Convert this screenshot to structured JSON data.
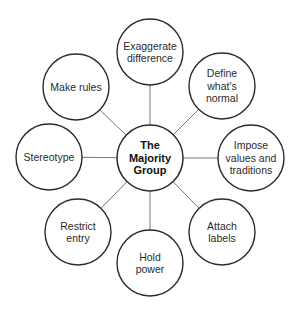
{
  "diagram": {
    "center": {
      "id": "majority",
      "lines": [
        "The",
        "Majority",
        "Group"
      ],
      "cx": 150,
      "cy": 158,
      "r": 33
    },
    "nodes": [
      {
        "id": "exaggerate",
        "lines": [
          "Exaggerate",
          "difference"
        ],
        "cx": 150,
        "cy": 52,
        "r": 33
      },
      {
        "id": "define-normal",
        "lines": [
          "Define",
          "what's",
          "normal"
        ],
        "cx": 222,
        "cy": 86,
        "r": 33
      },
      {
        "id": "impose-values",
        "lines": [
          "Impose",
          "values and",
          "traditions"
        ],
        "cx": 251,
        "cy": 158,
        "r": 33
      },
      {
        "id": "attach-labels",
        "lines": [
          "Attach",
          "labels"
        ],
        "cx": 222,
        "cy": 232,
        "r": 33
      },
      {
        "id": "hold-power",
        "lines": [
          "Hold",
          "power"
        ],
        "cx": 150,
        "cy": 263,
        "r": 33
      },
      {
        "id": "restrict-entry",
        "lines": [
          "Restrict",
          "entry"
        ],
        "cx": 78,
        "cy": 232,
        "r": 33
      },
      {
        "id": "stereotype",
        "lines": [
          "Stereotype"
        ],
        "cx": 49,
        "cy": 157,
        "r": 33
      },
      {
        "id": "make-rules",
        "lines": [
          "Make rules"
        ],
        "cx": 76,
        "cy": 87,
        "r": 33
      }
    ],
    "colors": {
      "stroke": "#2a2a2a",
      "connector": "#777777",
      "fill": "#ffffff"
    }
  }
}
